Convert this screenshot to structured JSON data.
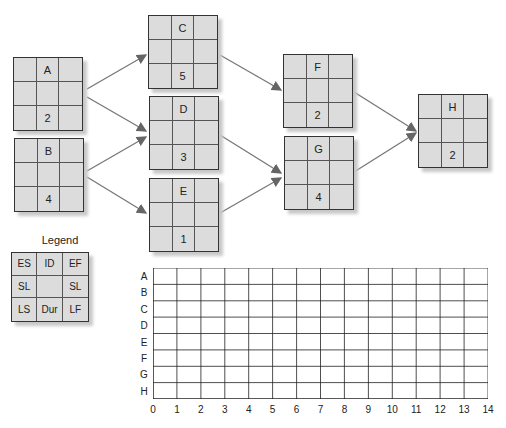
{
  "diagram": {
    "type": "activity-on-node network",
    "nodes": [
      {
        "id": "A",
        "duration": "2"
      },
      {
        "id": "B",
        "duration": "4"
      },
      {
        "id": "C",
        "duration": "5"
      },
      {
        "id": "D",
        "duration": "3"
      },
      {
        "id": "E",
        "duration": "1"
      },
      {
        "id": "F",
        "duration": "2"
      },
      {
        "id": "G",
        "duration": "4"
      },
      {
        "id": "H",
        "duration": "2"
      }
    ],
    "edges": [
      [
        "A",
        "C"
      ],
      [
        "A",
        "D"
      ],
      [
        "B",
        "D"
      ],
      [
        "B",
        "E"
      ],
      [
        "C",
        "F"
      ],
      [
        "D",
        "G"
      ],
      [
        "E",
        "G"
      ],
      [
        "F",
        "H"
      ],
      [
        "G",
        "H"
      ]
    ]
  },
  "legend": {
    "title": "Legend",
    "cells": [
      "ES",
      "ID",
      "EF",
      "SL",
      "",
      "SL",
      "LS",
      "Dur",
      "LF"
    ]
  },
  "gantt_grid": {
    "rows": [
      "A",
      "B",
      "C",
      "D",
      "E",
      "F",
      "G",
      "H"
    ],
    "columns": [
      "0",
      "1",
      "2",
      "3",
      "4",
      "5",
      "6",
      "7",
      "8",
      "9",
      "10",
      "11",
      "12",
      "13",
      "14"
    ]
  }
}
